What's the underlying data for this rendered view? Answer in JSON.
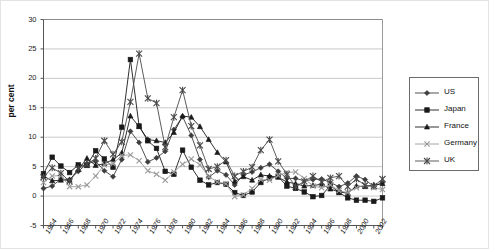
{
  "chart_data": {
    "type": "line",
    "title": "",
    "xlabel": "",
    "ylabel": "per cent",
    "ylim": [
      -5,
      30
    ],
    "ytick_step": 5,
    "yticks": [
      "30",
      "25",
      "20",
      "15",
      "10",
      "5",
      "0",
      "-5"
    ],
    "grid": true,
    "legend_position": "right",
    "x": [
      1964,
      1965,
      1966,
      1967,
      1968,
      1969,
      1970,
      1971,
      1972,
      1973,
      1974,
      1975,
      1976,
      1977,
      1978,
      1979,
      1980,
      1981,
      1982,
      1983,
      1984,
      1985,
      1986,
      1987,
      1988,
      1989,
      1990,
      1991,
      1992,
      1993,
      1994,
      1995,
      1996,
      1997,
      1998,
      1999,
      2000,
      2001,
      2002,
      2003
    ],
    "xtick_labels": [
      "1964",
      "1966",
      "1968",
      "1970",
      "1972",
      "1974",
      "1976",
      "1978",
      "1980",
      "1982",
      "1984",
      "1986",
      "1988",
      "1990",
      "1992",
      "1994",
      "1996",
      "1998",
      "2000",
      "2002"
    ],
    "xtick_step": 2,
    "series": [
      {
        "name": "US",
        "marker": "diamond",
        "color": "#3d3d3d",
        "values": [
          1.3,
          1.7,
          2.9,
          2.8,
          4.2,
          5.5,
          5.9,
          4.3,
          3.3,
          6.2,
          11.0,
          9.1,
          5.8,
          6.5,
          7.6,
          11.3,
          13.5,
          10.3,
          6.2,
          3.2,
          4.3,
          3.6,
          1.9,
          3.6,
          4.1,
          4.8,
          5.4,
          4.2,
          3.0,
          3.0,
          2.6,
          2.8,
          2.9,
          2.3,
          1.6,
          2.2,
          3.4,
          2.8,
          1.6,
          2.3
        ]
      },
      {
        "name": "Japan",
        "marker": "square",
        "color": "#1a1a1a",
        "values": [
          3.8,
          6.6,
          5.1,
          4.0,
          5.3,
          5.2,
          7.7,
          6.3,
          4.9,
          11.7,
          23.2,
          11.9,
          9.4,
          8.1,
          4.2,
          3.7,
          7.8,
          4.9,
          2.7,
          1.9,
          2.3,
          2.0,
          0.6,
          0.1,
          0.7,
          2.3,
          3.1,
          3.3,
          1.7,
          1.3,
          0.7,
          -0.1,
          0.1,
          1.8,
          0.6,
          -0.3,
          -0.7,
          -0.7,
          -0.9,
          -0.3
        ]
      },
      {
        "name": "France",
        "marker": "triangle",
        "color": "#1a1a1a",
        "values": [
          3.4,
          2.6,
          2.7,
          2.7,
          4.5,
          6.4,
          5.2,
          5.5,
          6.2,
          7.3,
          13.6,
          11.8,
          9.6,
          9.4,
          9.1,
          10.8,
          13.6,
          13.4,
          11.8,
          9.6,
          7.4,
          5.8,
          2.5,
          3.3,
          2.7,
          3.6,
          3.4,
          3.2,
          2.4,
          2.1,
          1.7,
          1.8,
          2.0,
          1.2,
          0.7,
          0.5,
          1.7,
          1.6,
          1.9,
          2.1
        ]
      },
      {
        "name": "Germany",
        "marker": "cross",
        "color": "#9a9a9a",
        "values": [
          2.3,
          3.4,
          3.5,
          1.6,
          1.6,
          1.9,
          3.4,
          5.3,
          5.5,
          6.9,
          7.0,
          6.0,
          4.3,
          3.7,
          2.7,
          4.1,
          5.4,
          6.3,
          5.3,
          3.3,
          2.4,
          2.1,
          -0.1,
          0.2,
          1.3,
          2.8,
          2.7,
          3.5,
          4.0,
          4.1,
          3.0,
          1.7,
          1.4,
          1.9,
          0.9,
          0.6,
          1.4,
          1.9,
          1.4,
          1.1
        ]
      },
      {
        "name": "UK",
        "marker": "star",
        "color": "#4a4a4a",
        "values": [
          3.2,
          4.8,
          3.9,
          2.5,
          4.7,
          5.4,
          6.4,
          9.4,
          7.1,
          9.2,
          16.0,
          24.2,
          16.6,
          15.8,
          8.3,
          13.4,
          18.0,
          11.9,
          8.6,
          4.6,
          5.0,
          6.1,
          3.4,
          4.2,
          4.9,
          7.8,
          9.6,
          5.9,
          3.7,
          1.6,
          2.5,
          3.4,
          2.4,
          3.1,
          3.4,
          1.6,
          2.9,
          1.8,
          1.7,
          2.9
        ]
      }
    ]
  },
  "legend": {
    "items": [
      {
        "label": "US"
      },
      {
        "label": "Japan"
      },
      {
        "label": "France"
      },
      {
        "label": "Germany"
      },
      {
        "label": "UK"
      }
    ]
  }
}
